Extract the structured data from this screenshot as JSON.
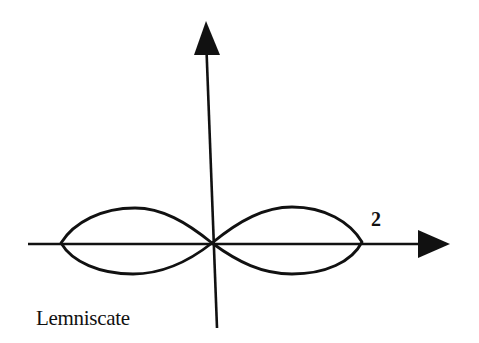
{
  "diagram": {
    "type": "polar-curve-sketch",
    "caption": "Lemniscate",
    "axis_label_x_max": "2",
    "colors": {
      "background": "#ffffff",
      "ink": "#111111"
    },
    "axes": {
      "horizontal": {
        "from": [
          28,
          244
        ],
        "to": [
          450,
          244
        ],
        "arrow": "right"
      },
      "vertical": {
        "from": [
          217,
          328
        ],
        "to": [
          206,
          22
        ],
        "arrow": "up"
      }
    },
    "curve": {
      "name": "lemniscate",
      "center": [
        212,
        243
      ],
      "left_extreme_x": 60,
      "right_extreme_x": 362,
      "loop_top_y": 207,
      "loop_bottom_y": 274
    }
  }
}
